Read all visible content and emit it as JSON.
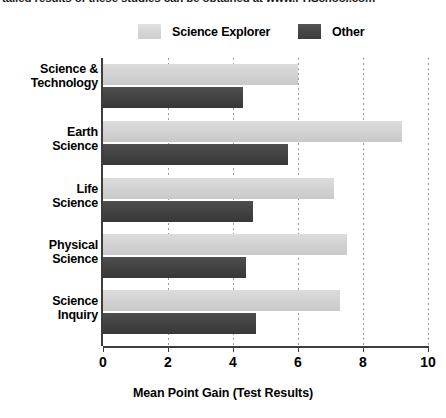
{
  "caption": {
    "text": "tailed results of these studies can be obtained at www.PHSchool.com"
  },
  "legend": {
    "position": "top",
    "items": [
      {
        "label": "Science Explorer",
        "color": "#d4d4d4",
        "swatch": "light-swatch"
      },
      {
        "label": "Other",
        "color": "#444444",
        "swatch": "dark-swatch"
      }
    ]
  },
  "chart_data": {
    "type": "bar",
    "orientation": "horizontal",
    "title": "",
    "xlabel": "Mean Point Gain (Test Results)",
    "ylabel": "",
    "xlim": [
      0,
      10
    ],
    "xticks": [
      0,
      2,
      4,
      6,
      8,
      10
    ],
    "xtick_labels": [
      "0",
      "2",
      "4",
      "6",
      "8",
      "10"
    ],
    "grid": true,
    "grid_axis": "x",
    "grid_style": "dotted",
    "legend_position": "top",
    "categories": [
      "Science & Technology",
      "Earth Science",
      "Life Science",
      "Physical Science",
      "Science Inquiry"
    ],
    "series": [
      {
        "name": "Science Explorer",
        "color": "#d4d4d4",
        "values": [
          6.0,
          9.2,
          7.1,
          7.5,
          7.3
        ]
      },
      {
        "name": "Other",
        "color": "#444444",
        "values": [
          4.3,
          5.7,
          4.6,
          4.4,
          4.7
        ]
      }
    ]
  }
}
